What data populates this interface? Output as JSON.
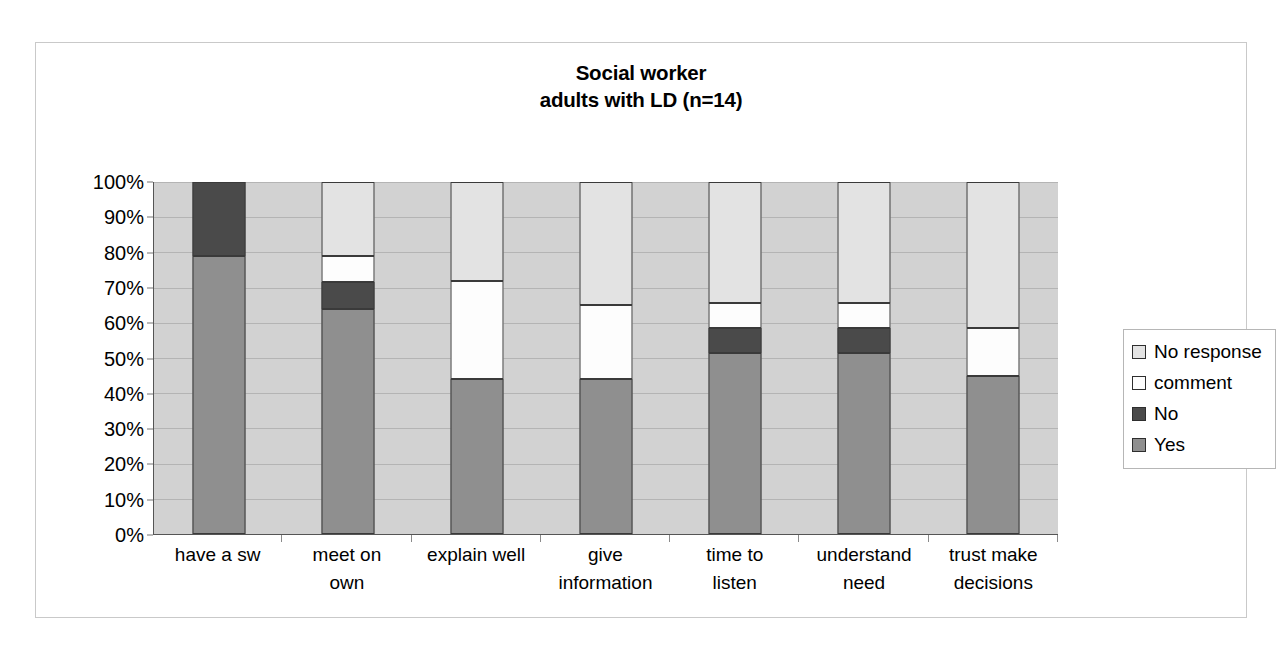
{
  "chart_data": {
    "type": "bar",
    "subtype": "stacked-100-percent",
    "title": "Social worker\nadults with LD (n=14)",
    "title_lines": [
      "Social worker",
      "adults with LD (n=14)"
    ],
    "xlabel": "",
    "ylabel": "",
    "ylim": [
      0,
      100
    ],
    "ytick_labels": [
      "100%",
      "90%",
      "80%",
      "70%",
      "60%",
      "50%",
      "40%",
      "30%",
      "20%",
      "10%",
      "0%"
    ],
    "ytick_values": [
      100,
      90,
      80,
      70,
      60,
      50,
      40,
      30,
      20,
      10,
      0
    ],
    "grid": true,
    "legend_position": "right",
    "categories": [
      "have  a sw",
      "meet on\nown",
      "explain well",
      "give\ninformation",
      "time to\nlisten",
      "understand\nneed",
      "trust make\ndecisions"
    ],
    "series": [
      {
        "name": "Yes",
        "color": "#8f8f8f",
        "values": [
          79,
          64,
          44,
          44,
          51.5,
          51.5,
          45
        ]
      },
      {
        "name": "No",
        "color": "#4a4a4a",
        "values": [
          21,
          7.5,
          0,
          0,
          7,
          7,
          0
        ]
      },
      {
        "name": "comment",
        "color": "#fdfdfd",
        "values": [
          0,
          7.5,
          28,
          21,
          7,
          7,
          13.5
        ]
      },
      {
        "name": "No response",
        "color": "#e3e3e3",
        "values": [
          0,
          21,
          28,
          35,
          34.5,
          34.5,
          41.5
        ]
      }
    ],
    "plot_background": "#d2d2d2"
  },
  "legend": {
    "items": [
      {
        "label": "No response",
        "color": "#e3e3e3"
      },
      {
        "label": "comment",
        "color": "#fdfdfd"
      },
      {
        "label": "No",
        "color": "#4a4a4a"
      },
      {
        "label": "Yes",
        "color": "#8f8f8f"
      }
    ]
  }
}
